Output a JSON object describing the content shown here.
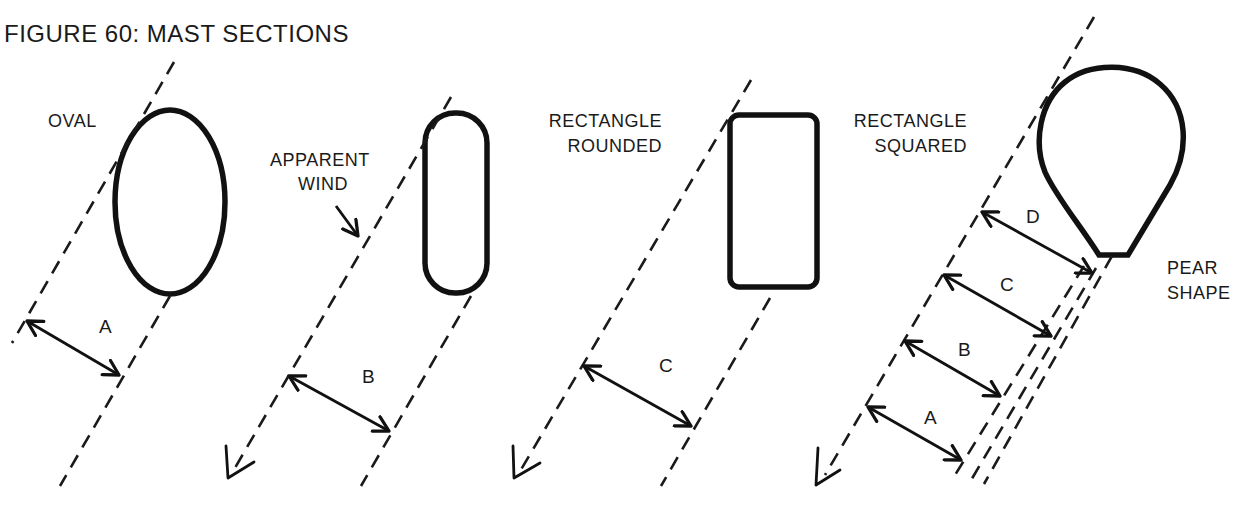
{
  "figure": {
    "title": "FIGURE 60: MAST SECTIONS"
  },
  "sections": [
    {
      "name": "oval",
      "label_lines": [
        "OVAL"
      ],
      "dimensions": [
        "A"
      ]
    },
    {
      "name": "rectangle-rounded",
      "label_lines": [
        "RECTANGLE",
        "ROUNDED"
      ],
      "dimensions": [
        "B"
      ]
    },
    {
      "name": "rectangle-squared",
      "label_lines": [
        "RECTANGLE",
        "SQUARED"
      ],
      "dimensions": [
        "C"
      ]
    },
    {
      "name": "pear-shape",
      "label_lines": [
        "PEAR",
        "SHAPE"
      ],
      "dimensions": [
        "D",
        "C",
        "B",
        "A"
      ]
    }
  ],
  "annotations": {
    "apparent_wind_lines": [
      "APPARENT",
      "WIND"
    ]
  },
  "colors": {
    "ink": "#1a1a1a",
    "background": "#ffffff"
  }
}
